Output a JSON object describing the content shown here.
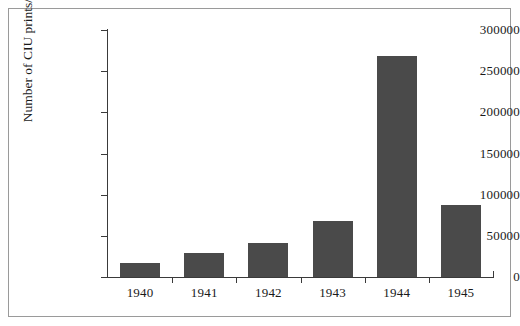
{
  "chart_data": {
    "type": "bar",
    "title": "",
    "xlabel": "",
    "ylabel": "Number of CIU prints/year",
    "categories": [
      "1940",
      "1941",
      "1942",
      "1943",
      "1944",
      "1945"
    ],
    "values": [
      17000,
      29000,
      41000,
      68000,
      268000,
      87000
    ],
    "ylim": [
      0,
      300000
    ],
    "yticks": [
      0,
      50000,
      100000,
      150000,
      200000,
      250000,
      300000
    ],
    "ytick_labels": [
      "0",
      "50000",
      "100000",
      "150000",
      "200000",
      "250000",
      "300000"
    ],
    "grid": false,
    "legend": null,
    "bar_color": "#4a4a4a",
    "axis_color": "#3a3a3a",
    "frame_color": "#9a9a9a",
    "background": "#ffffff"
  }
}
